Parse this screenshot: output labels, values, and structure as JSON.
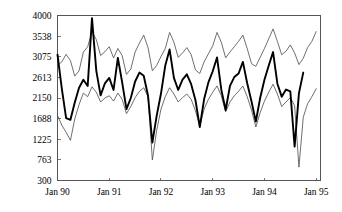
{
  "chart_data": {
    "type": "line",
    "title": "",
    "subtitle": "",
    "xlabel": "",
    "ylabel": "",
    "grid": false,
    "legend": "none",
    "xlim": [
      0,
      61
    ],
    "ylim": [
      300,
      4000
    ],
    "y_ticks": [
      300,
      763,
      1225,
      1688,
      2150,
      2613,
      3075,
      3538,
      4000
    ],
    "y_tick_labels": [
      "300",
      "763",
      "1225",
      "1688",
      "2150",
      "2613",
      "3075",
      "3538",
      "4000"
    ],
    "x_ticks": [
      0,
      12,
      24,
      36,
      48,
      60
    ],
    "x_tick_labels": [
      "Jan 90",
      "Jan 91",
      "Jan 92",
      "Jan 93",
      "Jan 94",
      "Jan 95"
    ],
    "series": [
      {
        "name": "actual",
        "style": "thick-black",
        "color": "#000000",
        "x": [
          0,
          1,
          2,
          3,
          4,
          5,
          6,
          7,
          8,
          9,
          10,
          11,
          12,
          13,
          14,
          15,
          16,
          17,
          18,
          19,
          20,
          21,
          22,
          23,
          24,
          25,
          26,
          27,
          28,
          29,
          30,
          31,
          32,
          33,
          34,
          35,
          36,
          37,
          38,
          39,
          40,
          41,
          42,
          43,
          44,
          45,
          46,
          47,
          48,
          49,
          50,
          51,
          52,
          53,
          54,
          55,
          56,
          57
        ],
        "values": [
          3120,
          2360,
          1700,
          1660,
          2050,
          2380,
          2560,
          2420,
          3940,
          2760,
          2210,
          2480,
          2600,
          2330,
          3050,
          2500,
          1900,
          2150,
          2520,
          2720,
          2650,
          2200,
          1150,
          1750,
          2250,
          2880,
          3240,
          2600,
          2330,
          2560,
          2680,
          2460,
          2100,
          1500,
          2120,
          2500,
          2750,
          3060,
          2330,
          1880,
          2420,
          2620,
          2700,
          2960,
          2480,
          2070,
          1620,
          2150,
          2560,
          2880,
          3180,
          2470,
          2180,
          2340,
          2300,
          1060,
          2260,
          2720
        ]
      },
      {
        "name": "upper-bound",
        "style": "thin",
        "color": "#4a4a4a",
        "x": [
          0,
          1,
          2,
          3,
          4,
          5,
          6,
          7,
          8,
          9,
          10,
          11,
          12,
          13,
          14,
          15,
          16,
          17,
          18,
          19,
          20,
          21,
          22,
          23,
          24,
          25,
          26,
          27,
          28,
          29,
          30,
          31,
          32,
          33,
          34,
          35,
          36,
          37,
          38,
          39,
          40,
          41,
          42,
          43,
          44,
          45,
          46,
          47,
          48,
          49,
          50,
          51,
          52,
          53,
          54,
          55,
          56,
          57,
          58,
          59,
          60
        ],
        "values": [
          2880,
          2960,
          3130,
          2990,
          2640,
          2760,
          3180,
          3300,
          3640,
          3460,
          3100,
          3190,
          3300,
          3050,
          3260,
          3100,
          2680,
          2800,
          3180,
          3380,
          3560,
          3280,
          2760,
          2880,
          3080,
          3260,
          3620,
          3400,
          3060,
          3160,
          3280,
          3120,
          2780,
          2700,
          2960,
          3140,
          3320,
          3620,
          3400,
          3050,
          3180,
          3300,
          3420,
          3560,
          3260,
          2920,
          2860,
          3060,
          3260,
          3480,
          3700,
          3420,
          3120,
          3200,
          3340,
          3160,
          2900,
          3040,
          3280,
          3420,
          3640
        ]
      },
      {
        "name": "lower-bound",
        "style": "thin",
        "color": "#4a4a4a",
        "x": [
          0,
          1,
          2,
          3,
          4,
          5,
          6,
          7,
          8,
          9,
          10,
          11,
          12,
          13,
          14,
          15,
          16,
          17,
          18,
          19,
          20,
          21,
          22,
          23,
          24,
          25,
          26,
          27,
          28,
          29,
          30,
          31,
          32,
          33,
          34,
          35,
          36,
          37,
          38,
          39,
          40,
          41,
          42,
          43,
          44,
          45,
          46,
          47,
          48,
          49,
          50,
          51,
          52,
          53,
          54,
          55,
          56,
          57,
          58,
          59,
          60
        ],
        "values": [
          1760,
          1540,
          1380,
          1200,
          1680,
          2000,
          2260,
          2180,
          2400,
          2280,
          2060,
          2150,
          2200,
          2080,
          2260,
          2120,
          1800,
          1960,
          2160,
          2300,
          2380,
          2180,
          760,
          1420,
          1900,
          2180,
          2380,
          2240,
          2060,
          2160,
          2240,
          2120,
          1860,
          1520,
          1900,
          2120,
          2280,
          2420,
          2200,
          1840,
          2060,
          2200,
          2300,
          2420,
          2180,
          1880,
          1500,
          1820,
          2080,
          2280,
          2460,
          2240,
          1960,
          2060,
          2160,
          1980,
          600,
          1720,
          2020,
          2180,
          2360
        ]
      }
    ]
  }
}
